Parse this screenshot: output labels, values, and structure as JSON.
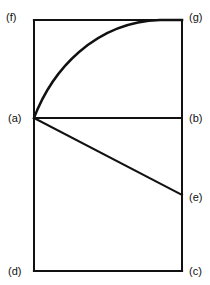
{
  "diagram": {
    "stroke_color": "#111111",
    "background": "#ffffff",
    "labels": {
      "f": "(f)",
      "g": "(g)",
      "a": "(a)",
      "b": "(b)",
      "e": "(e)",
      "d": "(d)",
      "c": "(c)"
    },
    "points": {
      "f": [
        34,
        20
      ],
      "g": [
        182,
        20
      ],
      "a": [
        34,
        118
      ],
      "b": [
        182,
        118
      ],
      "e": [
        182,
        195
      ],
      "d": [
        34,
        271
      ],
      "c": [
        182,
        271
      ]
    },
    "segments": [
      {
        "from": "f",
        "to": "g",
        "name": "top-edge"
      },
      {
        "from": "f",
        "to": "d",
        "name": "left-edge"
      },
      {
        "from": "g",
        "to": "c",
        "name": "right-edge"
      },
      {
        "from": "d",
        "to": "c",
        "name": "bottom-edge"
      },
      {
        "from": "a",
        "to": "b",
        "name": "horizontal-ab"
      },
      {
        "from": "a",
        "to": "e",
        "name": "sloped-ae"
      }
    ],
    "curves": [
      {
        "from": "a",
        "to": "g",
        "name": "curve-ag",
        "shape": "concave-rising"
      }
    ]
  }
}
